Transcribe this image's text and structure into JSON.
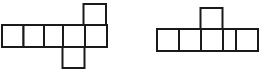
{
  "figure_panel": {
    "background_color": "#ffffff",
    "stroke_color": "#1a1a1a",
    "fill_color": "#ffffff",
    "stroke_width": 2,
    "cell_size": 21.5,
    "figure_count": 2,
    "figures": [
      {
        "id": "left-figure",
        "name": "hexomino-net-left",
        "cell_count": 7,
        "description": "Row of five squares with one square attached above the right end and one square attached below the fourth square",
        "cells": [
          {
            "name": "cell-row-1",
            "x": 2,
            "y": 25,
            "w": 21.5,
            "h": 22
          },
          {
            "name": "cell-row-2",
            "x": 23.5,
            "y": 25,
            "w": 20.5,
            "h": 22
          },
          {
            "name": "cell-row-3",
            "x": 44,
            "y": 25,
            "w": 19,
            "h": 22
          },
          {
            "name": "cell-row-4",
            "x": 63,
            "y": 25,
            "w": 22,
            "h": 22
          },
          {
            "name": "cell-row-5",
            "x": 85,
            "y": 25,
            "w": 22,
            "h": 22
          },
          {
            "name": "cell-top",
            "x": 83.5,
            "y": 4,
            "w": 22.5,
            "h": 21
          },
          {
            "name": "cell-bottom",
            "x": 62.5,
            "y": 47,
            "w": 22,
            "h": 21
          }
        ]
      },
      {
        "id": "right-figure",
        "name": "pentomino-net-right",
        "cell_count": 5,
        "description": "Row of four squares with one square attached above the second square",
        "cells": [
          {
            "name": "cell-row-1",
            "x": 157,
            "y": 29,
            "w": 22,
            "h": 22
          },
          {
            "name": "cell-row-2",
            "x": 179,
            "y": 29,
            "w": 22,
            "h": 22
          },
          {
            "name": "cell-row-3",
            "x": 201,
            "y": 29,
            "w": 22,
            "h": 22
          },
          {
            "name": "cell-row-4",
            "x": 223,
            "y": 29,
            "w": 22,
            "h": 22
          },
          {
            "name": "cell-row-5",
            "x": 236,
            "y": 29,
            "w": 22,
            "h": 22
          },
          {
            "name": "cell-top",
            "x": 200.5,
            "y": 8,
            "w": 22,
            "h": 21
          }
        ]
      }
    ]
  },
  "chart_data": {
    "type": "diagram",
    "title": "",
    "xlabel": "",
    "ylabel": "",
    "grid": false,
    "legend": "none",
    "annotations": [],
    "shapes": [
      {
        "label": "left polyomino",
        "unit_squares": 7,
        "rows": [
          {
            "row": "middle",
            "squares": 5
          },
          {
            "row": "above",
            "squares": 1
          },
          {
            "row": "below",
            "squares": 1
          }
        ]
      },
      {
        "label": "right polyomino",
        "unit_squares": 5,
        "rows": [
          {
            "row": "middle",
            "squares": 4
          },
          {
            "row": "above",
            "squares": 1
          }
        ]
      }
    ]
  }
}
